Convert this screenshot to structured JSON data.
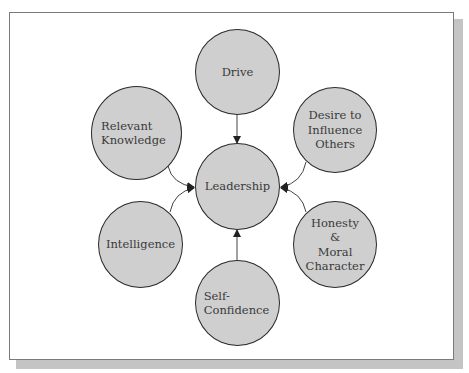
{
  "diagram": {
    "type": "hub-and-spoke",
    "colors": {
      "node_fill": "#cfcfcf",
      "node_border": "#2a2a2a",
      "connector": "#444444",
      "frame_border": "#7a7a7a",
      "shadow": "#c4c4c4"
    },
    "center": {
      "id": "leadership",
      "label": "Leadership"
    },
    "nodes": [
      {
        "id": "drive",
        "label": "Drive"
      },
      {
        "id": "relevant-knowledge",
        "label": "Relevant\nKnowledge"
      },
      {
        "id": "desire-to-influence-others",
        "label": "Desire to\nInfluence\nOthers"
      },
      {
        "id": "intelligence",
        "label": "Intelligence"
      },
      {
        "id": "honesty-moral-character",
        "label": "Honesty\n&\nMoral\nCharacter"
      },
      {
        "id": "self-confidence",
        "label": "Self-\nConfidence"
      }
    ],
    "edges": [
      {
        "from": "drive",
        "to": "leadership"
      },
      {
        "from": "relevant-knowledge",
        "to": "leadership"
      },
      {
        "from": "desire-to-influence-others",
        "to": "leadership"
      },
      {
        "from": "intelligence",
        "to": "leadership"
      },
      {
        "from": "honesty-moral-character",
        "to": "leadership"
      },
      {
        "from": "self-confidence",
        "to": "leadership"
      }
    ]
  }
}
